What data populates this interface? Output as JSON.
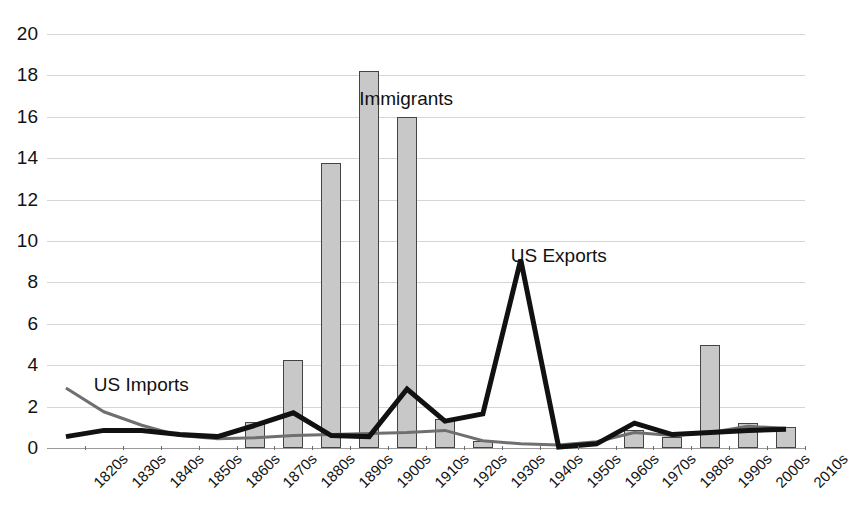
{
  "chart_data": {
    "type": "bar",
    "title": "",
    "subtitle": "",
    "xlabel": "",
    "ylabel": "",
    "ylim": [
      0,
      20
    ],
    "ytick_step": 2,
    "yticks": [
      "20",
      "18",
      "16",
      "14",
      "12",
      "10",
      "8",
      "6",
      "4",
      "2",
      "0"
    ],
    "grid": true,
    "legend_position": "inline-annotations",
    "categories": [
      "1820s",
      "1830s",
      "1840s",
      "1850s",
      "1860s",
      "1870s",
      "1880s",
      "1890s",
      "1900s",
      "1910s",
      "1920s",
      "1930s",
      "1940s",
      "1950s",
      "1960s",
      "1970s",
      "1980s",
      "1990s",
      "2000s",
      "2010s"
    ],
    "series": [
      {
        "name": "Immigrants",
        "type": "bar",
        "color": "#c8c8c8",
        "edge_color": "#444444",
        "values": [
          0.13,
          0.54,
          1.43,
          2.81,
          2.08,
          2.74,
          5.25,
          3.69,
          8.2,
          6.35,
          4.11,
          0.53,
          1.03,
          2.52,
          3.21,
          4.25,
          6.24,
          9.78,
          10.3,
          9.5
        ]
      },
      {
        "name": "US Imports",
        "type": "line",
        "color": "#6f6f6f",
        "line_width": 3,
        "values": [
          2.9,
          1.75,
          1.1,
          0.6,
          0.45,
          0.5,
          0.6,
          0.65,
          0.7,
          0.75,
          0.85,
          0.35,
          0.2,
          0.15,
          0.3,
          0.75,
          0.6,
          0.75,
          1.05,
          0.95
        ]
      },
      {
        "name": "US Exports",
        "type": "line",
        "color": "#111111",
        "line_width": 5,
        "values": [
          0.55,
          0.85,
          0.85,
          0.65,
          0.55,
          1.1,
          1.7,
          0.6,
          0.55,
          2.85,
          1.3,
          1.65,
          9.1,
          0.05,
          0.2,
          1.2,
          0.65,
          0.75,
          0.85,
          0.9
        ]
      }
    ],
    "bar_values_displayed": [
      0.13,
      0.54,
      1.43,
      2.81,
      2.08,
      2.74,
      5.25,
      3.69,
      8.2,
      6.35,
      4.11,
      0.53,
      1.03,
      2.52,
      3.21,
      4.25,
      6.24,
      9.78,
      10.3,
      9.5
    ],
    "annotations": [
      {
        "text": "US Imports",
        "x_category": "1830s",
        "y_value": 3.1
      },
      {
        "text": "Immigrants",
        "x_category": "1900s",
        "y_value": 16.9
      },
      {
        "text": "US Exports",
        "x_category": "1940s",
        "y_value": 9.3
      }
    ],
    "colors": {
      "bar_fill": "#c8c8c8",
      "bar_edge": "#444444",
      "imports_line": "#6f6f6f",
      "exports_line": "#111111",
      "gridline": "#d6d6d6",
      "axis": "#9a9a9a",
      "text": "#121212",
      "background": "#ffffff"
    },
    "bar_display_heights": [
      0.0,
      0.0,
      0.0,
      0.0,
      0.0,
      1.25,
      4.25,
      13.75,
      18.2,
      16.0,
      1.4,
      0.35,
      0.0,
      0.0,
      0.0,
      0.85,
      0.55,
      5.0,
      1.2,
      1.0
    ]
  }
}
